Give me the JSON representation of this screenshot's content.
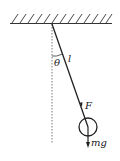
{
  "diagram": {
    "type": "pendulum",
    "labels": {
      "angle": "θ",
      "length": "l",
      "tension": "F",
      "weight": "mg"
    },
    "colors": {
      "stroke": "#222222",
      "background": "#ffffff"
    }
  }
}
